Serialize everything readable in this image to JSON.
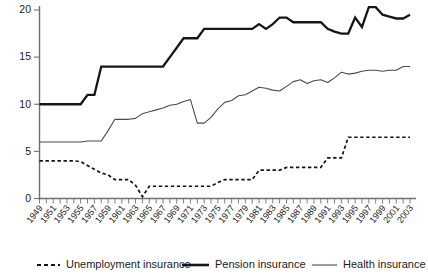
{
  "chart_data": {
    "type": "line",
    "title": "",
    "subtitle": "",
    "xlabel": "",
    "ylabel": "",
    "xlim": [
      1949,
      2003
    ],
    "ylim": [
      0,
      21
    ],
    "yticks": [
      0,
      5,
      10,
      15,
      20
    ],
    "grid": false,
    "legend_position": "bottom",
    "x": [
      1949,
      1950,
      1951,
      1952,
      1953,
      1954,
      1955,
      1956,
      1957,
      1958,
      1959,
      1960,
      1961,
      1962,
      1963,
      1964,
      1965,
      1966,
      1967,
      1968,
      1969,
      1970,
      1971,
      1972,
      1973,
      1974,
      1975,
      1976,
      1977,
      1978,
      1979,
      1980,
      1981,
      1982,
      1983,
      1984,
      1985,
      1986,
      1987,
      1988,
      1989,
      1990,
      1991,
      1992,
      1993,
      1994,
      1995,
      1996,
      1997,
      1998,
      1999,
      2000,
      2001,
      2002,
      2003
    ],
    "xtick_labels": [
      "1949",
      "1951",
      "1953",
      "1955",
      "1957",
      "1959",
      "1961",
      "1963",
      "1965",
      "1967",
      "1969",
      "1971",
      "1973",
      "1975",
      "1977",
      "1979",
      "1981",
      "1983",
      "1985",
      "1987",
      "1989",
      "1991",
      "1993",
      "1995",
      "1997",
      "1999",
      "2001",
      "2003"
    ],
    "series": [
      {
        "name": "Unemployment insurance",
        "style": "dashed",
        "color": "#121212",
        "values": [
          4.0,
          4.0,
          4.0,
          4.0,
          4.0,
          4.0,
          3.9,
          3.5,
          3.1,
          2.7,
          2.5,
          2.0,
          2.0,
          2.0,
          1.4,
          0.2,
          1.3,
          1.3,
          1.3,
          1.3,
          1.3,
          1.3,
          1.3,
          1.3,
          1.3,
          1.3,
          1.7,
          2.0,
          2.0,
          2.0,
          2.0,
          2.0,
          3.0,
          3.0,
          3.0,
          3.0,
          3.3,
          3.3,
          3.3,
          3.3,
          3.3,
          3.3,
          4.3,
          4.3,
          4.3,
          6.5,
          6.5,
          6.5,
          6.5,
          6.5,
          6.5,
          6.5,
          6.5,
          6.5,
          6.5
        ]
      },
      {
        "name": "Pension insurance",
        "style": "solid-thick",
        "color": "#161616",
        "values": [
          10.0,
          10.0,
          10.0,
          10.0,
          10.0,
          10.0,
          10.0,
          11.0,
          11.0,
          14.0,
          14.0,
          14.0,
          14.0,
          14.0,
          14.0,
          14.0,
          14.0,
          14.0,
          14.0,
          15.0,
          16.0,
          17.0,
          17.0,
          17.0,
          18.0,
          18.0,
          18.0,
          18.0,
          18.0,
          18.0,
          18.0,
          18.0,
          18.5,
          18.0,
          18.5,
          19.2,
          19.2,
          18.7,
          18.7,
          18.7,
          18.7,
          18.7,
          18.0,
          17.7,
          17.5,
          17.5,
          19.2,
          18.2,
          20.3,
          20.3,
          19.5,
          19.3,
          19.1,
          19.1,
          19.5
        ]
      },
      {
        "name": "Health insurance",
        "style": "solid-thin",
        "color": "#4a4a4a",
        "values": [
          6.0,
          6.0,
          6.0,
          6.0,
          6.0,
          6.0,
          6.0,
          6.1,
          6.1,
          6.1,
          7.2,
          8.4,
          8.4,
          8.4,
          8.5,
          9.0,
          9.2,
          9.4,
          9.6,
          9.9,
          10.0,
          10.3,
          10.5,
          8.0,
          8.0,
          8.6,
          9.5,
          10.2,
          10.4,
          10.9,
          11.0,
          11.4,
          11.8,
          11.7,
          11.5,
          11.4,
          11.9,
          12.4,
          12.6,
          12.2,
          12.5,
          12.6,
          12.3,
          12.8,
          13.4,
          13.2,
          13.3,
          13.5,
          13.6,
          13.6,
          13.5,
          13.6,
          13.6,
          14.0,
          14.0
        ]
      }
    ],
    "legend": [
      {
        "label": "Unemployment insurance",
        "style": "dashed"
      },
      {
        "label": "Pension insurance",
        "style": "solid-thick"
      },
      {
        "label": "Health insurance",
        "style": "solid-thin"
      }
    ]
  }
}
